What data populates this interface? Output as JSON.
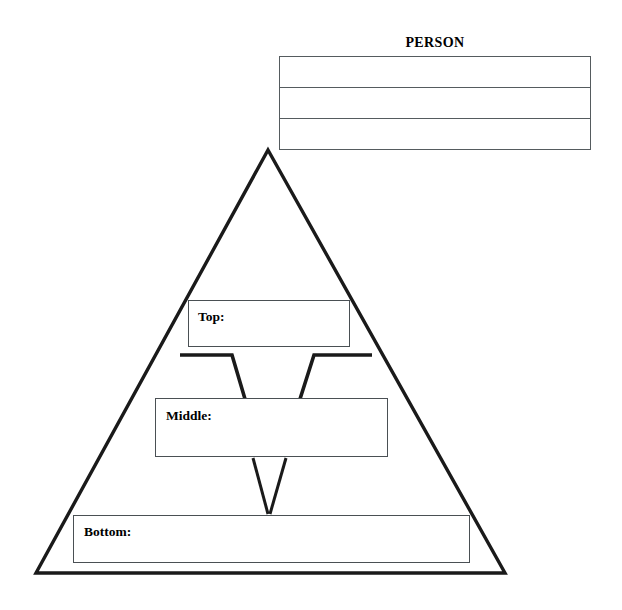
{
  "person": {
    "title": "PERSON",
    "rows": [
      {
        "cells": [
          ""
        ]
      },
      {
        "cells": [
          ""
        ]
      },
      {
        "cells": [
          ""
        ]
      }
    ],
    "row_count": 3
  },
  "pyramid": {
    "levels": [
      {
        "id": "top",
        "label": "Top:",
        "value": ""
      },
      {
        "id": "middle",
        "label": "Middle:",
        "value": ""
      },
      {
        "id": "bottom",
        "label": "Bottom:",
        "value": ""
      }
    ]
  },
  "colors": {
    "stroke": "#1a1a1a",
    "box_border": "#4a5054",
    "table_border": "#555b5e",
    "background": "#ffffff",
    "text": "#000000"
  },
  "geometry": {
    "triangle_apex": [
      268,
      150
    ],
    "triangle_left": [
      36,
      573
    ],
    "triangle_right": [
      505,
      573
    ]
  }
}
